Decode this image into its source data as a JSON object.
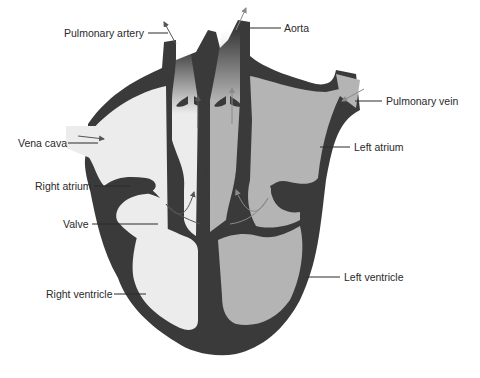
{
  "diagram": {
    "colors": {
      "wall": "#3a3a3a",
      "right_side_fill": "#ececec",
      "left_side_fill": "#b4b4b4",
      "background": "#ffffff",
      "arrow_right": "#555555",
      "arrow_left": "#8a8a8a",
      "label_text": "#2a2a2a"
    },
    "labels": {
      "pulmonary_artery": "Pulmonary artery",
      "aorta": "Aorta",
      "pulmonary_vein": "Pulmonary vein",
      "vena_cava": "Vena cava",
      "left_atrium": "Left atrium",
      "right_atrium": "Right atrium",
      "valve": "Valve",
      "left_ventricle": "Left ventricle",
      "right_ventricle": "Right ventricle"
    }
  }
}
